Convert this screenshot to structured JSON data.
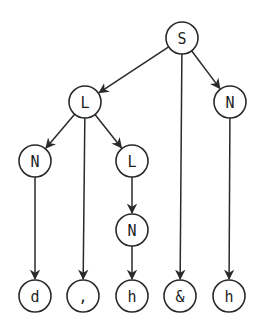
{
  "diagram": {
    "type": "tree",
    "node_radius": 16,
    "stroke_color": "#2a2a2a",
    "nodes": [
      {
        "id": "n0",
        "label": "S",
        "x": 182,
        "y": 38
      },
      {
        "id": "n1",
        "label": "L",
        "x": 85,
        "y": 102
      },
      {
        "id": "n2",
        "label": "N",
        "x": 230,
        "y": 102
      },
      {
        "id": "n3",
        "label": "N",
        "x": 35,
        "y": 161
      },
      {
        "id": "n4",
        "label": "L",
        "x": 132,
        "y": 161
      },
      {
        "id": "n5",
        "label": "N",
        "x": 132,
        "y": 230
      },
      {
        "id": "n6",
        "label": "d",
        "x": 35,
        "y": 296
      },
      {
        "id": "n7",
        "label": ",",
        "x": 83,
        "y": 296
      },
      {
        "id": "n8",
        "label": "h",
        "x": 132,
        "y": 296
      },
      {
        "id": "n9",
        "label": "&",
        "x": 180,
        "y": 296
      },
      {
        "id": "n10",
        "label": "h",
        "x": 229,
        "y": 296
      }
    ],
    "edges": [
      {
        "from": "n0",
        "to": "n1"
      },
      {
        "from": "n0",
        "to": "n9"
      },
      {
        "from": "n0",
        "to": "n2"
      },
      {
        "from": "n1",
        "to": "n3"
      },
      {
        "from": "n1",
        "to": "n7"
      },
      {
        "from": "n1",
        "to": "n4"
      },
      {
        "from": "n3",
        "to": "n6"
      },
      {
        "from": "n4",
        "to": "n5"
      },
      {
        "from": "n5",
        "to": "n8"
      },
      {
        "from": "n2",
        "to": "n10"
      }
    ]
  }
}
